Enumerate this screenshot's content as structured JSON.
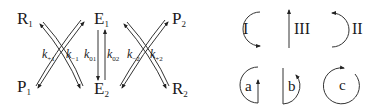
{
  "diagram": {
    "scheme": {
      "species": {
        "R1": {
          "base": "R",
          "sub": "1"
        },
        "P1": {
          "base": "P",
          "sub": "1"
        },
        "E1": {
          "base": "E",
          "sub": "1"
        },
        "E2": {
          "base": "E",
          "sub": "2"
        },
        "P2": {
          "base": "P",
          "sub": "2"
        },
        "R2": {
          "base": "R",
          "sub": "2"
        }
      },
      "rate_constants": {
        "k_plus1": {
          "base": "k",
          "sub": "+1"
        },
        "k_minus1": {
          "base": "k",
          "sub": "−1"
        },
        "k_01": {
          "base": "k",
          "sub": "01"
        },
        "k_02": {
          "base": "k",
          "sub": "02"
        },
        "k_minus2": {
          "base": "k",
          "sub": "−2"
        },
        "k_plus2": {
          "base": "k",
          "sub": "+2"
        }
      }
    },
    "cycle_symbols": {
      "I": "I",
      "II": "II",
      "III": "III",
      "a": "a",
      "b": "b",
      "c": "c"
    },
    "stroke_color": "#333333"
  }
}
